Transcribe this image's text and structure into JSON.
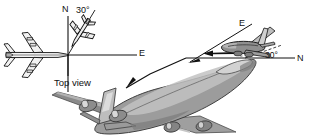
{
  "figure": {
    "kind": "aircraft-heading-diagram",
    "background_color": "#ffffff",
    "ink_color": "#111111",
    "body_fill": "#9a9a9a",
    "body_fill_light": "#c8c8c8",
    "body_fill_dark": "#6e6e6e"
  },
  "top_view_panel": {
    "caption": "Top view",
    "axis_north_label": "N",
    "axis_east_label": "E",
    "angle_label": "30°",
    "large_aircraft_name": "airliner-top-view",
    "small_aircraft_name": "small-aircraft-top-view",
    "small_aircraft_heading_deg": 30
  },
  "perspective_panel": {
    "axis_east_label": "E",
    "axis_north_label": "N",
    "angle_label": "30°",
    "aircraft_name": "small-aircraft-perspective",
    "velocity_arrow_name": "velocity-arrow"
  },
  "foreground": {
    "aircraft_name": "large-airliner-perspective",
    "leader_line_name": "callout-leader-line"
  }
}
